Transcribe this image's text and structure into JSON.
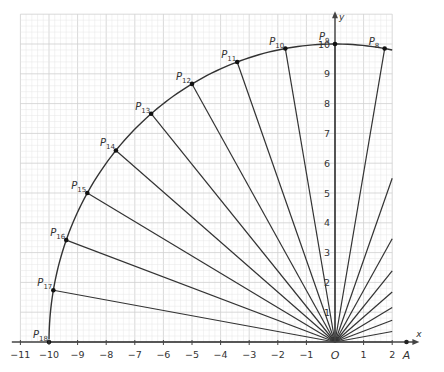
{
  "diagram": {
    "axes": {
      "x_label": "x",
      "y_label": "y",
      "origin_label": "O",
      "x_ticks": [
        -11,
        -10,
        -9,
        -8,
        -7,
        -6,
        -5,
        -4,
        -3,
        -2,
        -1,
        1,
        2
      ],
      "y_ticks": [
        1,
        2,
        3,
        4,
        5,
        6,
        7,
        8,
        9,
        10
      ],
      "extra_point_label": "A",
      "extra_point_x": 2.5
    },
    "circle": {
      "radius": 10,
      "center": [
        0,
        0
      ]
    },
    "points": [
      {
        "name": "P",
        "sub": "8",
        "angle_deg": 80
      },
      {
        "name": "P",
        "sub": "9",
        "angle_deg": 90
      },
      {
        "name": "P",
        "sub": "10",
        "angle_deg": 100
      },
      {
        "name": "P",
        "sub": "11",
        "angle_deg": 110
      },
      {
        "name": "P",
        "sub": "12",
        "angle_deg": 120
      },
      {
        "name": "P",
        "sub": "13",
        "angle_deg": 130
      },
      {
        "name": "P",
        "sub": "14",
        "angle_deg": 140
      },
      {
        "name": "P",
        "sub": "15",
        "angle_deg": 150
      },
      {
        "name": "P",
        "sub": "16",
        "angle_deg": 160
      },
      {
        "name": "P",
        "sub": "17",
        "angle_deg": 170
      },
      {
        "name": "P",
        "sub": "18",
        "angle_deg": 180
      }
    ],
    "clipped_ray_angles_deg": [
      0,
      10,
      20,
      30,
      40,
      50,
      60,
      70
    ],
    "colors": {
      "grid": "#d9d9d9",
      "line": "#333333",
      "axis": "#444444",
      "label": "#333333"
    }
  }
}
